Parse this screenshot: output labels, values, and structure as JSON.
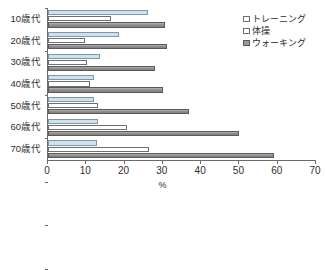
{
  "chart_data": {
    "type": "bar",
    "orientation": "horizontal",
    "title": "",
    "xlabel": "%",
    "ylabel": "",
    "xlim": [
      0,
      70
    ],
    "xticks": [
      0,
      10,
      20,
      30,
      40,
      50,
      60,
      70
    ],
    "grid": false,
    "legend_position": "top-right",
    "categories": [
      "10歳代",
      "20歳代",
      "30歳代",
      "40歳代",
      "50歳代",
      "60歳代",
      "70歳代"
    ],
    "series": [
      {
        "name": "トレーニング",
        "color": "#cfe2ec",
        "values": [
          26.2,
          18.5,
          13.6,
          12.1,
          12.0,
          13.1,
          12.8
        ]
      },
      {
        "name": "体操",
        "color": "#ffffff",
        "values": [
          16.5,
          9.6,
          10.2,
          10.9,
          13.1,
          20.6,
          26.4
        ]
      },
      {
        "name": "ウォーキング",
        "color": "#9a9a9a",
        "values": [
          30.5,
          31.1,
          28.0,
          30.1,
          36.9,
          50.0,
          59.0
        ]
      }
    ]
  },
  "axis": {
    "x_tick_labels": [
      "0",
      "10",
      "20",
      "30",
      "40",
      "50",
      "60",
      "70"
    ],
    "x_title": "%"
  },
  "legend": {
    "items": [
      {
        "label": "トレーニング"
      },
      {
        "label": "体操"
      },
      {
        "label": "ウォーキング"
      }
    ]
  }
}
